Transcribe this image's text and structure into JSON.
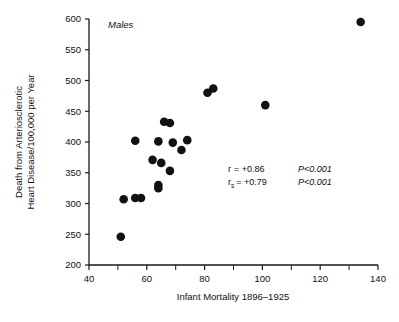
{
  "figure": {
    "group_label": "Males",
    "annotations": {
      "r_symbol": "r",
      "r_value": "= +0.86",
      "r_p": "P<0.001",
      "rs_symbol": "r",
      "rs_sub": "s",
      "rs_value": "= +0.79",
      "rs_p": "P<0.001"
    },
    "colors": {
      "marker": "#111111",
      "axis": "#1a1a1a",
      "background": "#ffffff"
    }
  },
  "chart_data": {
    "type": "scatter",
    "title": "",
    "subtitle": "",
    "xlabel": "Infant Mortality 1896–1925",
    "ylabel": "Death from Arteriosclerotic Heart Disease/100,000 per Year",
    "ylabel_lines": [
      "Death from Arteriosclerotic",
      "Heart Disease/100,000 per Year"
    ],
    "xlim": [
      40,
      140
    ],
    "ylim": [
      200,
      600
    ],
    "xticks": [
      40,
      60,
      80,
      100,
      120,
      140
    ],
    "xticklabels": [
      "40",
      "60",
      "80",
      "100",
      "120",
      "140"
    ],
    "xticks_minor": [
      50,
      70,
      90,
      110,
      130
    ],
    "yticks": [
      200,
      250,
      300,
      350,
      400,
      450,
      500,
      550,
      600
    ],
    "yticklabels": [
      "200",
      "250",
      "300",
      "350",
      "400",
      "450",
      "500",
      "550",
      "600"
    ],
    "grid": false,
    "legend": null,
    "annotations": [
      {
        "text": "Males",
        "x": 46,
        "y": 592,
        "style": "italic"
      },
      {
        "text": "r = +0.86   P<0.001",
        "x": 104,
        "y": 390
      },
      {
        "text": "rs = +0.79   P<0.001",
        "x": 104,
        "y": 368
      }
    ],
    "series": [
      {
        "name": "Males",
        "marker": "filled-circle",
        "color": "#111111",
        "points": [
          {
            "x": 51,
            "y": 246
          },
          {
            "x": 52,
            "y": 307
          },
          {
            "x": 56,
            "y": 309
          },
          {
            "x": 58,
            "y": 309
          },
          {
            "x": 56,
            "y": 402
          },
          {
            "x": 62,
            "y": 371
          },
          {
            "x": 64,
            "y": 325
          },
          {
            "x": 64,
            "y": 330
          },
          {
            "x": 64,
            "y": 401
          },
          {
            "x": 65,
            "y": 366
          },
          {
            "x": 66,
            "y": 433
          },
          {
            "x": 68,
            "y": 431
          },
          {
            "x": 68,
            "y": 353
          },
          {
            "x": 69,
            "y": 399
          },
          {
            "x": 72,
            "y": 387
          },
          {
            "x": 74,
            "y": 403
          },
          {
            "x": 81,
            "y": 480
          },
          {
            "x": 83,
            "y": 487
          },
          {
            "x": 101,
            "y": 460
          },
          {
            "x": 134,
            "y": 595
          }
        ]
      }
    ]
  }
}
